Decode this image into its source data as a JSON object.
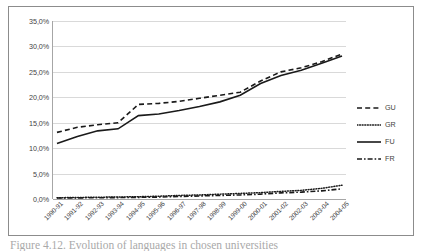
{
  "figure": {
    "caption": "Figure 4.12. Evolution of languages in chosen universities"
  },
  "legend": {
    "position": "right",
    "items": [
      {
        "label": "GU",
        "style": "dashed"
      },
      {
        "label": "GR",
        "style": "dotted"
      },
      {
        "label": "FU",
        "style": "solid"
      },
      {
        "label": "FR",
        "style": "dash-dot"
      }
    ]
  },
  "colors": {
    "line": "#1a1a1a",
    "grid": "#d9d9d9",
    "axis": "#a6a6a6",
    "frame": "#8c8c8c",
    "text": "#3f3f3f"
  },
  "chart_data": {
    "type": "line",
    "title": "",
    "xlabel": "",
    "ylabel": "",
    "ylim": [
      0,
      35
    ],
    "ytick_labels": [
      "0,0%",
      "5,0%",
      "10,0%",
      "15,0%",
      "20,0%",
      "25,0%",
      "30,0%",
      "35,0%"
    ],
    "ytick_values": [
      0,
      5,
      10,
      15,
      20,
      25,
      30,
      35
    ],
    "grid": true,
    "legend_position": "right",
    "categories": [
      "1990-91",
      "1991-92",
      "1992-93",
      "1993-94",
      "1994-95",
      "1995-96",
      "1996-97",
      "1997-98",
      "1998-99",
      "1999-00",
      "2000-01",
      "2001-02",
      "2002-03",
      "2003-04",
      "2004-05"
    ],
    "series": [
      {
        "name": "GU",
        "style": "dashed",
        "values": [
          13.1,
          14.1,
          14.6,
          15.0,
          18.6,
          18.8,
          19.2,
          19.8,
          20.4,
          21.0,
          23.2,
          25.0,
          25.8,
          27.0,
          28.5
        ]
      },
      {
        "name": "GR",
        "style": "dotted",
        "values": [
          0.25,
          0.3,
          0.35,
          0.4,
          0.45,
          0.55,
          0.7,
          0.8,
          0.95,
          1.1,
          1.25,
          1.5,
          1.7,
          2.1,
          2.7
        ]
      },
      {
        "name": "FU",
        "style": "solid",
        "values": [
          10.9,
          12.3,
          13.4,
          13.8,
          16.4,
          16.7,
          17.4,
          18.2,
          19.1,
          20.4,
          22.7,
          24.3,
          25.3,
          26.7,
          28.1
        ]
      },
      {
        "name": "FR",
        "style": "dash-dot",
        "values": [
          0.2,
          0.22,
          0.25,
          0.28,
          0.32,
          0.38,
          0.5,
          0.6,
          0.7,
          0.8,
          0.95,
          1.2,
          1.35,
          1.6,
          2.0
        ]
      }
    ]
  }
}
